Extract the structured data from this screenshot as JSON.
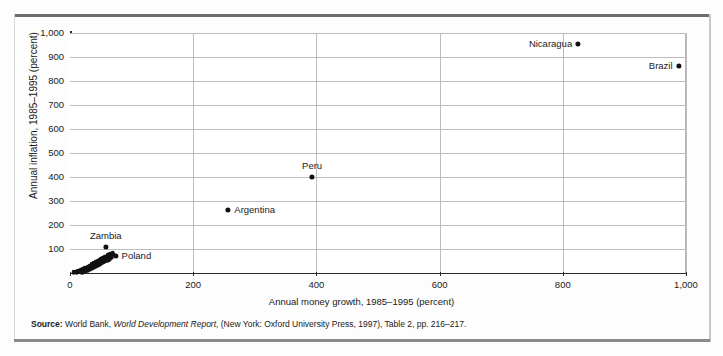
{
  "chart_data": {
    "type": "scatter",
    "title": "",
    "xlabel": "Annual money growth, 1985–1995 (percent)",
    "ylabel": "Annual inflation, 1985–1995 (percent)",
    "xlim": [
      0,
      1000
    ],
    "ylim": [
      0,
      1000
    ],
    "grid": true,
    "legend_position": "none",
    "xticks": [
      {
        "value": 0,
        "label": "0"
      },
      {
        "value": 200,
        "label": "200"
      },
      {
        "value": 400,
        "label": "400"
      },
      {
        "value": 600,
        "label": "600"
      },
      {
        "value": 800,
        "label": "800"
      },
      {
        "value": 1000,
        "label": "1,000"
      }
    ],
    "yticks": [
      {
        "value": 100,
        "label": "100"
      },
      {
        "value": 200,
        "label": "200"
      },
      {
        "value": 300,
        "label": "300"
      },
      {
        "value": 400,
        "label": "400"
      },
      {
        "value": 500,
        "label": "500"
      },
      {
        "value": 600,
        "label": "600"
      },
      {
        "value": 700,
        "label": "700"
      },
      {
        "value": 800,
        "label": "800"
      },
      {
        "value": 900,
        "label": "900"
      },
      {
        "value": 1000,
        "label": "1,000"
      }
    ],
    "labeled_points": [
      {
        "name": "Nicaragua",
        "x": 825,
        "y": 955,
        "label_pos": "left-of"
      },
      {
        "name": "Brazil",
        "x": 988,
        "y": 862,
        "label_pos": "left-of"
      },
      {
        "name": "Peru",
        "x": 393,
        "y": 400,
        "label_pos": "above"
      },
      {
        "name": "Argentina",
        "x": 257,
        "y": 262,
        "label_pos": "right-of"
      },
      {
        "name": "Zambia",
        "x": 58,
        "y": 110,
        "label_pos": "above"
      },
      {
        "name": "Poland",
        "x": 74,
        "y": 72,
        "label_pos": "right-of"
      }
    ],
    "unlabeled_points": [
      {
        "x": 6,
        "y": 4
      },
      {
        "x": 9,
        "y": 6
      },
      {
        "x": 11,
        "y": 3
      },
      {
        "x": 13,
        "y": 8
      },
      {
        "x": 14,
        "y": 5
      },
      {
        "x": 16,
        "y": 10
      },
      {
        "x": 17,
        "y": 6
      },
      {
        "x": 18,
        "y": 13
      },
      {
        "x": 19,
        "y": 8
      },
      {
        "x": 20,
        "y": 4
      },
      {
        "x": 21,
        "y": 16
      },
      {
        "x": 22,
        "y": 11
      },
      {
        "x": 23,
        "y": 7
      },
      {
        "x": 24,
        "y": 19
      },
      {
        "x": 25,
        "y": 13
      },
      {
        "x": 26,
        "y": 9
      },
      {
        "x": 27,
        "y": 22
      },
      {
        "x": 28,
        "y": 16
      },
      {
        "x": 29,
        "y": 12
      },
      {
        "x": 30,
        "y": 26
      },
      {
        "x": 31,
        "y": 20
      },
      {
        "x": 32,
        "y": 15
      },
      {
        "x": 33,
        "y": 31
      },
      {
        "x": 34,
        "y": 24
      },
      {
        "x": 35,
        "y": 18
      },
      {
        "x": 36,
        "y": 36
      },
      {
        "x": 37,
        "y": 28
      },
      {
        "x": 38,
        "y": 22
      },
      {
        "x": 39,
        "y": 41
      },
      {
        "x": 40,
        "y": 33
      },
      {
        "x": 41,
        "y": 26
      },
      {
        "x": 42,
        "y": 45
      },
      {
        "x": 43,
        "y": 37
      },
      {
        "x": 44,
        "y": 30
      },
      {
        "x": 45,
        "y": 50
      },
      {
        "x": 46,
        "y": 42
      },
      {
        "x": 47,
        "y": 35
      },
      {
        "x": 48,
        "y": 55
      },
      {
        "x": 49,
        "y": 46
      },
      {
        "x": 50,
        "y": 39
      },
      {
        "x": 51,
        "y": 60
      },
      {
        "x": 52,
        "y": 52
      },
      {
        "x": 53,
        "y": 44
      },
      {
        "x": 54,
        "y": 64
      },
      {
        "x": 55,
        "y": 57
      },
      {
        "x": 56,
        "y": 48
      },
      {
        "x": 57,
        "y": 68
      },
      {
        "x": 58,
        "y": 62
      },
      {
        "x": 60,
        "y": 52
      },
      {
        "x": 61,
        "y": 73
      },
      {
        "x": 62,
        "y": 66
      },
      {
        "x": 64,
        "y": 58
      },
      {
        "x": 65,
        "y": 78
      },
      {
        "x": 66,
        "y": 70
      },
      {
        "x": 68,
        "y": 63
      },
      {
        "x": 69,
        "y": 84
      },
      {
        "x": 70,
        "y": 76
      }
    ]
  },
  "source": {
    "prefix": "Source:",
    "text_1": " World Bank, ",
    "italic": "World Development Report",
    "text_2": ", (New York: Oxford University Press, 1997), Table 2, pp. 216–217."
  }
}
